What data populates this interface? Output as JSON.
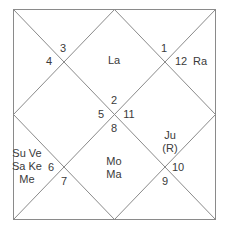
{
  "chart": {
    "type": "north-indian-kundali",
    "frame": {
      "x1": 13,
      "y1": 9,
      "x2": 216,
      "y2": 219
    },
    "line_color": "#8a8a8a"
  },
  "house_numbers": [
    {
      "id": "h3",
      "text": "3",
      "x": 63,
      "y": 48
    },
    {
      "id": "h4",
      "text": "4",
      "x": 49,
      "y": 61
    },
    {
      "id": "h1",
      "text": "1",
      "x": 164,
      "y": 48
    },
    {
      "id": "h12",
      "text": "12",
      "x": 181,
      "y": 61
    },
    {
      "id": "h2",
      "text": "2",
      "x": 114,
      "y": 100
    },
    {
      "id": "h5",
      "text": "5",
      "x": 101,
      "y": 114
    },
    {
      "id": "h11",
      "text": "11",
      "x": 129,
      "y": 114
    },
    {
      "id": "h8",
      "text": "8",
      "x": 114,
      "y": 128
    },
    {
      "id": "h6",
      "text": "6",
      "x": 51,
      "y": 167
    },
    {
      "id": "h7",
      "text": "7",
      "x": 64,
      "y": 181
    },
    {
      "id": "h10",
      "text": "10",
      "x": 178,
      "y": 167
    },
    {
      "id": "h9",
      "text": "9",
      "x": 165,
      "y": 181
    }
  ],
  "planets": [
    {
      "id": "house1",
      "lines": [
        "La"
      ],
      "x": 114,
      "y": 60
    },
    {
      "id": "house12",
      "lines": [
        "Ra"
      ],
      "x": 200,
      "y": 61
    },
    {
      "id": "house11",
      "lines": [
        "Ju",
        "(R)"
      ],
      "x": 170,
      "y": 142
    },
    {
      "id": "house7",
      "lines": [
        "Su Ve",
        "Sa Ke",
        "Me"
      ],
      "x": 27,
      "y": 166
    },
    {
      "id": "house8",
      "lines": [
        "Mo",
        "Ma"
      ],
      "x": 114,
      "y": 168
    }
  ]
}
